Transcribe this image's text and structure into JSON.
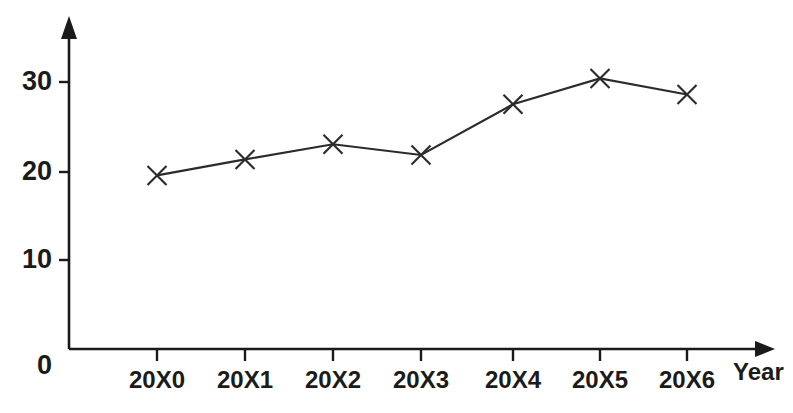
{
  "chart_data": {
    "type": "line",
    "title": "",
    "xlabel": "Year",
    "ylabel": "",
    "categories": [
      "20X0",
      "20X1",
      "20X2",
      "20X3",
      "20X4",
      "20X5",
      "20X6"
    ],
    "values": [
      19.5,
      21.3,
      23.0,
      21.8,
      27.5,
      30.4,
      28.6
    ],
    "series": [
      {
        "name": "",
        "values": [
          19.5,
          21.3,
          23.0,
          21.8,
          27.5,
          30.4,
          28.6
        ]
      }
    ],
    "y_ticks": [
      0,
      10,
      20,
      30
    ],
    "y_tick_labels": [
      "0",
      "10",
      "20",
      "30"
    ],
    "ylim": [
      0,
      37
    ],
    "xlim_categories": 7,
    "grid": false,
    "legend": false,
    "legend_position": "none",
    "marker": "x",
    "line_color": "#2b2b2b",
    "axis_color": "#1a1a1a",
    "background_color": "#ffffff",
    "y_axis_has_arrow": true,
    "x_axis_has_arrow": true
  },
  "labels": {
    "y_zero": "0",
    "y_ten": "10",
    "y_twenty": "20",
    "y_thirty": "30",
    "x_0": "20X0",
    "x_1": "20X1",
    "x_2": "20X2",
    "x_3": "20X3",
    "x_4": "20X4",
    "x_5": "20X5",
    "x_6": "20X6",
    "x_axis_title": "Year"
  }
}
